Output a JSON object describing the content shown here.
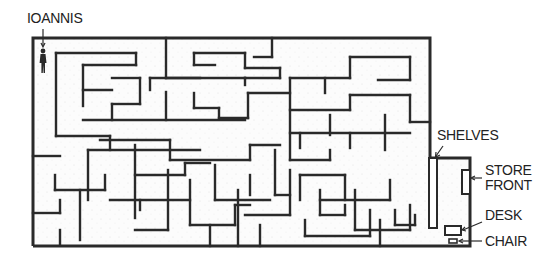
{
  "diagram": {
    "type": "maze",
    "ink_color": "#2a2a2a",
    "floor_color": "#fbfbfb",
    "labels": {
      "start": "IOANNIS",
      "shelves": "SHELVES",
      "store_front_line1": "STORE",
      "store_front_line2": "FRONT",
      "desk": "DESK",
      "chair": "CHAIR"
    },
    "figure": "person-standing",
    "outer_wall": {
      "x": 33,
      "y": 38,
      "right": 430,
      "bottom": 246
    },
    "store": {
      "x": 430,
      "y": 158,
      "right": 470,
      "bottom": 246
    },
    "walls": [
      [
        56,
        53,
        136,
        53
      ],
      [
        136,
        53,
        136,
        65
      ],
      [
        83,
        65,
        136,
        65
      ],
      [
        83,
        65,
        83,
        106
      ],
      [
        83,
        90,
        112,
        90
      ],
      [
        112,
        78,
        140,
        78
      ],
      [
        140,
        78,
        140,
        104
      ],
      [
        112,
        104,
        140,
        104
      ],
      [
        112,
        104,
        112,
        120
      ],
      [
        83,
        120,
        245,
        120
      ],
      [
        56,
        53,
        56,
        136
      ],
      [
        56,
        136,
        110,
        136
      ],
      [
        110,
        136,
        110,
        150
      ],
      [
        166,
        38,
        166,
        78
      ],
      [
        166,
        78,
        200,
        78
      ],
      [
        166,
        92,
        166,
        120
      ],
      [
        194,
        53,
        245,
        53
      ],
      [
        194,
        53,
        194,
        65
      ],
      [
        194,
        65,
        215,
        65
      ],
      [
        245,
        53,
        245,
        68
      ],
      [
        245,
        68,
        280,
        68
      ],
      [
        280,
        68,
        280,
        78
      ],
      [
        245,
        78,
        280,
        78
      ],
      [
        272,
        38,
        272,
        57
      ],
      [
        254,
        57,
        272,
        57
      ],
      [
        150,
        78,
        150,
        90
      ],
      [
        150,
        78,
        245,
        78
      ],
      [
        245,
        78,
        245,
        85
      ],
      [
        194,
        93,
        194,
        108
      ],
      [
        194,
        108,
        219,
        108
      ],
      [
        219,
        108,
        219,
        118
      ],
      [
        219,
        118,
        248,
        118
      ],
      [
        248,
        93,
        248,
        118
      ],
      [
        248,
        93,
        290,
        93
      ],
      [
        290,
        78,
        290,
        160
      ],
      [
        290,
        78,
        350,
        78
      ],
      [
        350,
        78,
        350,
        57
      ],
      [
        350,
        57,
        410,
        57
      ],
      [
        410,
        57,
        410,
        80
      ],
      [
        378,
        80,
        410,
        80
      ],
      [
        325,
        78,
        325,
        93
      ],
      [
        290,
        110,
        350,
        110
      ],
      [
        350,
        110,
        350,
        95
      ],
      [
        350,
        95,
        410,
        95
      ],
      [
        410,
        95,
        410,
        122
      ],
      [
        410,
        122,
        430,
        122
      ],
      [
        330,
        115,
        330,
        135
      ],
      [
        385,
        115,
        385,
        150
      ],
      [
        290,
        133,
        410,
        133
      ],
      [
        300,
        133,
        300,
        148
      ],
      [
        350,
        133,
        350,
        148
      ],
      [
        100,
        140,
        170,
        140
      ],
      [
        170,
        140,
        170,
        160
      ],
      [
        170,
        160,
        250,
        160
      ],
      [
        250,
        160,
        250,
        145
      ],
      [
        250,
        145,
        280,
        145
      ],
      [
        88,
        150,
        88,
        200
      ],
      [
        88,
        150,
        200,
        150
      ],
      [
        33,
        156,
        60,
        156
      ],
      [
        55,
        175,
        55,
        190
      ],
      [
        55,
        190,
        105,
        190
      ],
      [
        105,
        175,
        105,
        190
      ],
      [
        135,
        145,
        135,
        218
      ],
      [
        135,
        175,
        185,
        175
      ],
      [
        185,
        175,
        185,
        163
      ],
      [
        185,
        163,
        210,
        163
      ],
      [
        110,
        200,
        190,
        200
      ],
      [
        140,
        200,
        140,
        210
      ],
      [
        80,
        190,
        80,
        240
      ],
      [
        33,
        213,
        60,
        213
      ],
      [
        60,
        200,
        60,
        213
      ],
      [
        60,
        230,
        60,
        245
      ],
      [
        168,
        170,
        168,
        230
      ],
      [
        168,
        230,
        135,
        230
      ],
      [
        190,
        180,
        190,
        225
      ],
      [
        190,
        225,
        235,
        225
      ],
      [
        235,
        225,
        235,
        205
      ],
      [
        235,
        205,
        250,
        205
      ],
      [
        215,
        165,
        215,
        200
      ],
      [
        215,
        200,
        270,
        200
      ],
      [
        238,
        190,
        238,
        246
      ],
      [
        250,
        175,
        250,
        195
      ],
      [
        275,
        150,
        275,
        195
      ],
      [
        275,
        195,
        290,
        195
      ],
      [
        290,
        170,
        290,
        215
      ],
      [
        245,
        215,
        290,
        215
      ],
      [
        300,
        175,
        300,
        200
      ],
      [
        300,
        175,
        345,
        175
      ],
      [
        345,
        175,
        345,
        200
      ],
      [
        320,
        200,
        390,
        200
      ],
      [
        390,
        200,
        390,
        180
      ],
      [
        290,
        160,
        330,
        160
      ],
      [
        330,
        160,
        330,
        150
      ],
      [
        210,
        225,
        210,
        246
      ],
      [
        260,
        225,
        260,
        246
      ],
      [
        305,
        220,
        305,
        236
      ],
      [
        305,
        236,
        370,
        236
      ],
      [
        370,
        210,
        370,
        236
      ],
      [
        320,
        190,
        320,
        215
      ],
      [
        320,
        215,
        345,
        215
      ],
      [
        345,
        215,
        345,
        205
      ],
      [
        355,
        190,
        355,
        230
      ],
      [
        355,
        230,
        410,
        230
      ],
      [
        410,
        205,
        410,
        230
      ],
      [
        380,
        220,
        380,
        246
      ],
      [
        395,
        210,
        395,
        225
      ],
      [
        395,
        225,
        415,
        225
      ],
      [
        415,
        225,
        415,
        215
      ]
    ],
    "furniture": {
      "shelves_rect": {
        "x": 429,
        "y": 158,
        "w": 8,
        "h": 70
      },
      "store_front_rect": {
        "x": 462,
        "y": 170,
        "w": 8,
        "h": 24
      },
      "desk_rect": {
        "x": 445,
        "y": 226,
        "w": 16,
        "h": 9
      },
      "chair_rect": {
        "x": 449,
        "y": 239,
        "w": 8,
        "h": 4
      }
    }
  }
}
